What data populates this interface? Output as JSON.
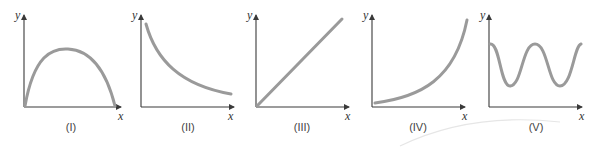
{
  "figure": {
    "graphs": [
      {
        "label": "(I)",
        "x_axis": "x",
        "y_axis": "y",
        "shape": "concave-down arc (parabola) starting at origin"
      },
      {
        "label": "(II)",
        "x_axis": "x",
        "y_axis": "y",
        "shape": "decreasing convex curve"
      },
      {
        "label": "(III)",
        "x_axis": "x",
        "y_axis": "y",
        "shape": "straight line through origin"
      },
      {
        "label": "(IV)",
        "x_axis": "x",
        "y_axis": "y",
        "shape": "increasing convex (exponential) curve"
      },
      {
        "label": "(V)",
        "x_axis": "x",
        "y_axis": "y",
        "shape": "oscillating wave"
      }
    ],
    "colors": {
      "axis": "#3a3a3a",
      "curve": "#9a9a9a"
    }
  }
}
